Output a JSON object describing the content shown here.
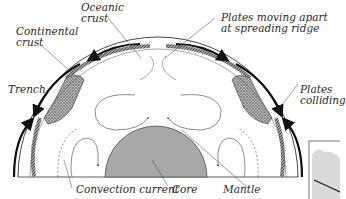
{
  "diagram": {
    "type": "cross-section",
    "labels": {
      "oceanic_crust": [
        "Oceanic",
        "crust"
      ],
      "continental_crust": [
        "Continental",
        "crust"
      ],
      "plates_moving_apart": [
        "Plates moving apart",
        "at spreading ridge"
      ],
      "trench": "Trench",
      "plates_colliding": [
        "Plates",
        "colliding"
      ],
      "convection_current": "Convection current",
      "core": "Core",
      "mantle": "Mantle"
    },
    "colors": {
      "core_fill": "#a8a8a8",
      "line": "#333333",
      "arrow": "#111111",
      "crust_fill": "#8a8a8a",
      "inset_fill": "#d9d9d9"
    }
  }
}
